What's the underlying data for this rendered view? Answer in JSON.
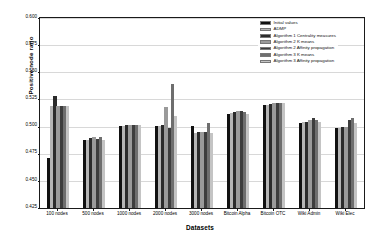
{
  "chart_data": {
    "type": "bar",
    "title": "",
    "xlabel": "Datasets",
    "ylabel": "Positive node ratio",
    "ylim": [
      0.425,
      0.6
    ],
    "yticks": [
      "0.425",
      "0.450",
      "0.475",
      "0.500",
      "0.525",
      "0.550",
      "0.575",
      "0.600"
    ],
    "ytick_values": [
      0.425,
      0.45,
      0.475,
      0.5,
      0.525,
      0.55,
      0.575,
      0.6
    ],
    "grid": true,
    "legend_position": "upper right",
    "categories": [
      "100 nodes",
      "500 nodes",
      "1000 nodes",
      "2000 nodes",
      "3000 nodes",
      "Bitcoin Alpha",
      "Bitcoin OTC",
      "Wiki Admin",
      "Wiki Elec"
    ],
    "series": [
      {
        "name": "Initial values",
        "color": "#111111",
        "values": [
          0.4715,
          0.4875,
          0.5005,
          0.5005,
          0.5005,
          0.5115,
          0.5195,
          0.5035,
          0.4985
        ]
      },
      {
        "name": "ADMP",
        "color": "#b5b5b5",
        "values": [
          0.519,
          0.488,
          0.501,
          0.501,
          0.4945,
          0.5125,
          0.52,
          0.504,
          0.499
        ]
      },
      {
        "name": "Algorithm 1 Centrality measures",
        "color": "#2b2b2b",
        "values": [
          0.5285,
          0.4895,
          0.5015,
          0.5015,
          0.495,
          0.513,
          0.521,
          0.5045,
          0.4995
        ]
      },
      {
        "name": "Algorithm 2 K means",
        "color": "#9a9a9a",
        "values": [
          0.519,
          0.4905,
          0.5015,
          0.5185,
          0.495,
          0.514,
          0.5215,
          0.506,
          0.5
        ]
      },
      {
        "name": "Algorithm 2 Affinity propagation",
        "color": "#3d3d3d",
        "values": [
          0.519,
          0.489,
          0.5015,
          0.499,
          0.495,
          0.5145,
          0.5215,
          0.5075,
          0.506
        ]
      },
      {
        "name": "Algorithm 3 K means",
        "color": "#6e6e6e",
        "values": [
          0.519,
          0.4905,
          0.5015,
          0.539,
          0.5035,
          0.513,
          0.5215,
          0.506,
          0.5075
        ]
      },
      {
        "name": "Algorithm 3 Affinity propagation",
        "color": "#c4c4c4",
        "values": [
          0.519,
          0.488,
          0.5015,
          0.5095,
          0.4945,
          0.5115,
          0.5215,
          0.5045,
          0.5035
        ]
      }
    ]
  }
}
